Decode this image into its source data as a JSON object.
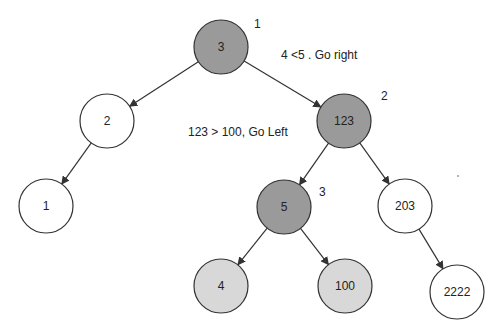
{
  "diagram": {
    "type": "binary-search-tree",
    "title": "",
    "colors": {
      "visited": "#9a9a9a",
      "candidate": "#d8d8d8",
      "default": "#ffffff",
      "stroke": "#333333",
      "text": "#222222"
    },
    "nodes": [
      {
        "id": "n3",
        "label": "3",
        "cx": 221,
        "cy": 47,
        "state": "visited"
      },
      {
        "id": "n2",
        "label": "2",
        "cx": 107,
        "cy": 121,
        "state": "default"
      },
      {
        "id": "n123",
        "label": "123",
        "cx": 344,
        "cy": 121,
        "state": "visited"
      },
      {
        "id": "n1",
        "label": "1",
        "cx": 46,
        "cy": 206,
        "state": "default"
      },
      {
        "id": "n5",
        "label": "5",
        "cx": 284,
        "cy": 207,
        "state": "visited"
      },
      {
        "id": "n203",
        "label": "203",
        "cx": 405,
        "cy": 206,
        "state": "default"
      },
      {
        "id": "n4",
        "label": "4",
        "cx": 221,
        "cy": 286,
        "state": "candidate"
      },
      {
        "id": "n100",
        "label": "100",
        "cx": 345,
        "cy": 286,
        "state": "candidate"
      },
      {
        "id": "n2222",
        "label": "2222",
        "cx": 457,
        "cy": 292,
        "state": "default"
      }
    ],
    "edges": [
      {
        "from": "n3",
        "to": "n2"
      },
      {
        "from": "n3",
        "to": "n123"
      },
      {
        "from": "n2",
        "to": "n1"
      },
      {
        "from": "n123",
        "to": "n5"
      },
      {
        "from": "n123",
        "to": "n203"
      },
      {
        "from": "n5",
        "to": "n4"
      },
      {
        "from": "n5",
        "to": "n100"
      },
      {
        "from": "n203",
        "to": "n2222"
      }
    ],
    "annotations": [
      {
        "id": "step-1",
        "text": "1",
        "x": 254,
        "y": 28
      },
      {
        "id": "step-1-note",
        "text": "4 <5 . Go right",
        "x": 281,
        "y": 59
      },
      {
        "id": "step-2",
        "text": "2",
        "x": 381,
        "y": 100
      },
      {
        "id": "step-2-note",
        "text": "123 > 100, Go Left",
        "x": 188,
        "y": 136
      },
      {
        "id": "step-3",
        "text": "3",
        "x": 319,
        "y": 196
      }
    ]
  }
}
